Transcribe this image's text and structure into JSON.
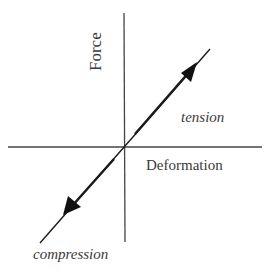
{
  "diagram": {
    "axes": {
      "y_label": "Force",
      "x_label": "Deformation"
    },
    "regions": {
      "upper": "tension",
      "lower": "compression"
    },
    "colors": {
      "line": "#1a1a1a",
      "axis": "#444444",
      "text": "#3a3a3a"
    }
  }
}
